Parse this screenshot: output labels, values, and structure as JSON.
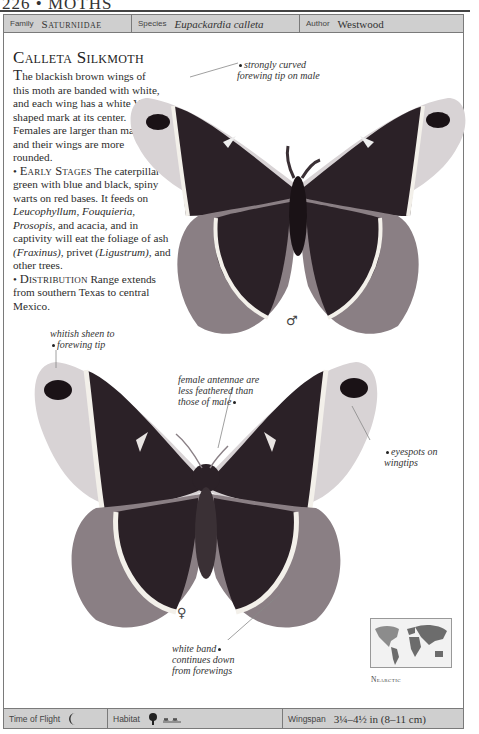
{
  "page_header": {
    "page_number": "226",
    "separator": "•",
    "section": "MOTHS"
  },
  "info_bar": {
    "family": {
      "label": "Family",
      "value": "Saturniidae"
    },
    "species": {
      "label": "Species",
      "value": "Eupackardia calleta"
    },
    "author": {
      "label": "Author",
      "value": "Westwood"
    }
  },
  "article": {
    "title": "Calleta Silkmoth",
    "intro_dropcap": "T",
    "intro": "he blackish brown wings of this moth are banded with white, and each wing has a white V-shaped mark at its center. Females are larger than males, and their wings are more rounded.",
    "early_stages": {
      "bullet": "•",
      "heading": "Early Stages",
      "text_1": " The caterpillar is green with blue and black, spiny warts on red bases. It feeds on ",
      "plant_1": "Leucophyllum",
      "sep_1": ", ",
      "plant_2": "Fouquieria",
      "sep_2": ", ",
      "plant_3": "Prosopis",
      "text_2": ", and acacia, and in captivity will eat the foliage of ash ",
      "plant_4": "(Fraxinus)",
      "text_3": ", privet ",
      "plant_5": "(Ligustrum)",
      "text_4": ", and other trees."
    },
    "distribution": {
      "bullet": "•",
      "heading": "Distribution",
      "text": " Range extends from southern Texas to central Mexico."
    }
  },
  "annotations": {
    "male_tip": [
      "strongly curved",
      "forewing tip on male"
    ],
    "sheen": [
      "whitish sheen to",
      "forewing tip"
    ],
    "antennae": [
      "female antennae are",
      "less feathered than",
      "those of male"
    ],
    "eyespots": [
      "eyespots on",
      "wingtips"
    ],
    "white_band": [
      "white band",
      "continues down",
      "from forewings"
    ]
  },
  "specimens": {
    "male_symbol": "♂",
    "female_symbol": "♀"
  },
  "map": {
    "region_label": "Nearctic"
  },
  "footer_bar": {
    "time_of_flight": {
      "label": "Time of Flight",
      "icon": "crescent-moon-icon"
    },
    "habitat": {
      "label": "Habitat",
      "icons": [
        "tree-icon",
        "scrub-icon"
      ]
    },
    "wingspan": {
      "label": "Wingspan",
      "value": "3¼–4½ in (8–11 cm)"
    }
  },
  "colors": {
    "bar_fill": "#cfcfcf",
    "bar_border": "#7a7a7a",
    "wing_dark": "#2a2026",
    "wing_band": "#f2eee8",
    "wing_margin": "#8a7f84"
  }
}
